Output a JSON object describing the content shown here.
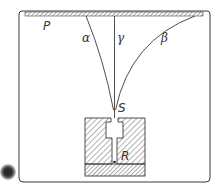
{
  "diagram": {
    "labels": {
      "plate": "P",
      "alpha": "α",
      "gamma": "γ",
      "beta": "β",
      "slit": "S",
      "source": "R"
    },
    "colors": {
      "line": "#3a3a3a",
      "hatch": "#555555",
      "background": "#ffffff",
      "blob": "#555555"
    }
  }
}
